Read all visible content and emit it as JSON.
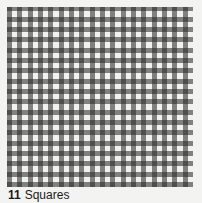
{
  "figure": {
    "pattern": "gingham-check",
    "colors": {
      "background": "#f3f3f1",
      "light": "#ececea",
      "mid": "#9a9a9a",
      "dark": "#4a4a4a"
    },
    "caption": {
      "number": "11",
      "label": "Squares"
    }
  }
}
